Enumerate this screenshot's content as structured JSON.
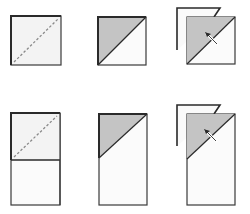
{
  "diagram": {
    "colors": {
      "paper": "#f4f4f4",
      "paper_white": "#fbfbfb",
      "shaded": "#c4c4c4",
      "outline": "#3a3a3a",
      "dashed": "#8a8a8a",
      "background": "#ffffff"
    },
    "rows": [
      {
        "name": "square",
        "steps": [
          {
            "id": "step-1",
            "description": "Square with dashed diagonal fold line"
          },
          {
            "id": "step-2",
            "description": "Square folded along diagonal, upper-left triangle shaded"
          },
          {
            "id": "step-3",
            "description": "Folded square with flap behind and fold arrow"
          }
        ]
      },
      {
        "name": "rectangle",
        "steps": [
          {
            "id": "step-1",
            "description": "Rectangle with dashed diagonal fold line on upper square"
          },
          {
            "id": "step-2",
            "description": "Rectangle with upper-left triangle folded and shaded"
          },
          {
            "id": "step-3",
            "description": "Folded rectangle with flap behind and fold arrow"
          }
        ]
      }
    ]
  }
}
